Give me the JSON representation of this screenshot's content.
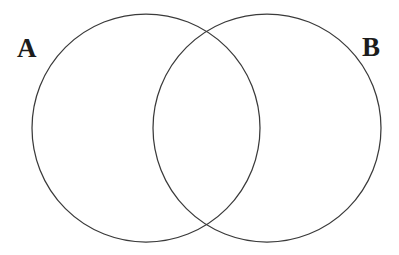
{
  "diagram": {
    "kind": "venn-diagram",
    "background_color": "#ffffff",
    "stroke_color": "#3a3a3a",
    "stroke_width": 1.25,
    "label_color": "#1c1c1c",
    "canvas": {
      "width": 399,
      "height": 255
    },
    "sets": [
      {
        "id": "A",
        "label": "A",
        "label_position": "outside-left",
        "circle": {
          "cx": 146,
          "cy": 128,
          "r": 114
        }
      },
      {
        "id": "B",
        "label": "B",
        "label_position": "outside-right",
        "circle": {
          "cx": 267,
          "cy": 128,
          "r": 114
        }
      }
    ],
    "regions": {
      "a_only": "",
      "intersection": "",
      "b_only": ""
    },
    "intersection_points": [
      {
        "x": 207,
        "y": 32
      },
      {
        "x": 207,
        "y": 223
      }
    ]
  }
}
